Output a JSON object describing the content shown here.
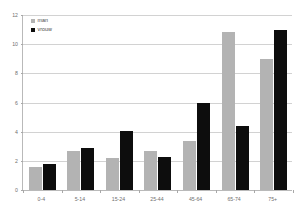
{
  "chart_data": {
    "type": "bar",
    "title": "",
    "subtitle": "",
    "xlabel": "",
    "ylabel": "",
    "categories": [
      "0-4",
      "5-14",
      "15-24",
      "25-44",
      "45-64",
      "65-74",
      "75+"
    ],
    "series": [
      {
        "name": "man",
        "color": "#b3b3b3",
        "values": [
          1.6,
          2.7,
          2.2,
          2.65,
          3.35,
          10.85,
          8.95
        ]
      },
      {
        "name": "vrouw",
        "color": "#0d0d0d",
        "values": [
          1.75,
          2.9,
          4.05,
          2.25,
          5.95,
          4.4,
          10.95
        ]
      }
    ],
    "ylim": [
      0,
      12
    ],
    "yticks": [
      0,
      2,
      4,
      6,
      8,
      10,
      12
    ],
    "ytick_labels": [
      "0",
      "2",
      "4",
      "6",
      "8",
      "10",
      "12"
    ],
    "grid": true,
    "legend_position": "top-left",
    "legend_entries": [
      {
        "label": "man",
        "swatch": "#b3b3b3"
      },
      {
        "label": "vrouw",
        "swatch": "#0d0d0d"
      }
    ]
  },
  "legend": {
    "man_label": "man",
    "vrouw_label": "vrouw"
  },
  "axis": {
    "y_top_label": "12",
    "y_bottom_label": "0"
  }
}
